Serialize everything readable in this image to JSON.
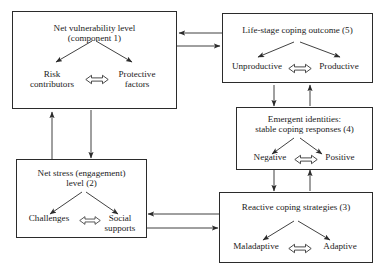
{
  "diagram": {
    "type": "flow-diagram",
    "nodes": [
      {
        "id": "net-vulnerability",
        "title": "Net vulnerability level\n(component 1)",
        "pole_left": "Risk\ncontributors",
        "pole_right": "Protective\nfactors",
        "component_number": "1"
      },
      {
        "id": "net-stress",
        "title": "Net stress (engagement)\nlevel (2)",
        "pole_left": "Challenges",
        "pole_right": "Social\nsupports",
        "component_number": "2"
      },
      {
        "id": "reactive-coping",
        "title": "Reactive coping strategies (3)",
        "pole_left": "Maladaptive",
        "pole_right": "Adaptive",
        "component_number": "3"
      },
      {
        "id": "emergent-identities",
        "title": "Emergent identities:\nstable coping responses (4)",
        "pole_left": "Negative",
        "pole_right": "Positive",
        "component_number": "4"
      },
      {
        "id": "life-stage-outcome",
        "title": "Life-stage coping outcome (5)",
        "pole_left": "Unproductive",
        "pole_right": "Productive",
        "component_number": "5"
      }
    ],
    "connectors": [
      {
        "from": "life-stage-outcome",
        "to": "net-vulnerability",
        "direction": "left"
      },
      {
        "from": "net-vulnerability",
        "to": "life-stage-outcome",
        "direction": "right"
      },
      {
        "from": "net-stress",
        "to": "net-vulnerability",
        "direction": "up"
      },
      {
        "from": "net-vulnerability",
        "to": "net-stress",
        "direction": "down"
      },
      {
        "from": "life-stage-outcome",
        "to": "emergent-identities",
        "direction": "down"
      },
      {
        "from": "emergent-identities",
        "to": "life-stage-outcome",
        "direction": "up"
      },
      {
        "from": "emergent-identities",
        "to": "reactive-coping",
        "direction": "down"
      },
      {
        "from": "reactive-coping",
        "to": "emergent-identities",
        "direction": "up"
      },
      {
        "from": "reactive-coping",
        "to": "net-stress",
        "direction": "left"
      },
      {
        "from": "net-stress",
        "to": "reactive-coping",
        "direction": "right"
      }
    ],
    "colors": {
      "stroke": "#2b2b2b",
      "text": "#1a1a1a",
      "background": "#ffffff"
    }
  }
}
